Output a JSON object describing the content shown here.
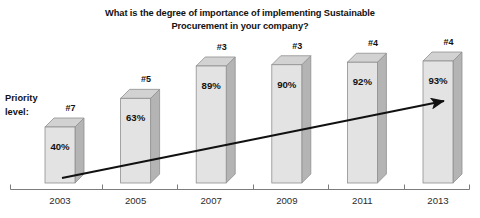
{
  "title": {
    "line1": "What is the degree of importance of implementing Sustainable",
    "line2": "Procurement in your company?"
  },
  "priority_legend": {
    "line1": "Priority",
    "line2": "level:"
  },
  "colors": {
    "bar_front": "#e3e3e3",
    "bar_side": "#b4b4b4",
    "bar_top": "#d2d2d2",
    "bar_outline": "#8f8f8f",
    "axis": "#7c7c7c",
    "arrow": "#111111",
    "text": "#121212",
    "background": "#ffffff"
  },
  "chart_data": {
    "type": "bar",
    "title": "What is the degree of importance of implementing Sustainable Procurement in your company?",
    "subtitle": "",
    "xlabel": "",
    "ylabel": "",
    "ylim": [
      0,
      100
    ],
    "grid": false,
    "legend_position": "none",
    "categories": [
      "2003",
      "2005",
      "2007",
      "2009",
      "2011",
      "2013"
    ],
    "values": [
      40,
      63,
      89,
      90,
      92,
      93
    ],
    "value_labels": [
      "40%",
      "63%",
      "89%",
      "90%",
      "92%",
      "93%"
    ],
    "rank_labels": [
      "#7",
      "#5",
      "#3",
      "#3",
      "#4",
      "#4"
    ],
    "series": [
      {
        "name": "Degree of importance (%)",
        "values": [
          40,
          63,
          89,
          90,
          92,
          93
        ]
      },
      {
        "name": "Priority level rank",
        "values": [
          7,
          5,
          3,
          3,
          4,
          4
        ]
      }
    ],
    "annotations": [
      {
        "type": "arrow",
        "text": "",
        "description": "upward trend arrow from 2003 bar to 2013 bar"
      }
    ]
  }
}
